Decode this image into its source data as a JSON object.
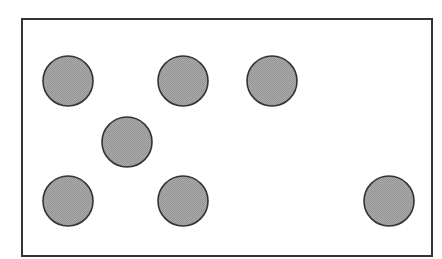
{
  "diagram": {
    "background": "#ffffff",
    "frame": {
      "x": 22,
      "y": 19,
      "width": 410,
      "height": 237,
      "stroke": "#333333",
      "stroke_width": 2
    },
    "circle_style": {
      "radius": 25,
      "fill": "#a3a3a3",
      "stroke": "#333333",
      "stroke_width": 1.6
    },
    "circles": [
      {
        "cx": 68,
        "cy": 81
      },
      {
        "cx": 183,
        "cy": 81
      },
      {
        "cx": 272,
        "cy": 81
      },
      {
        "cx": 127,
        "cy": 142
      },
      {
        "cx": 68,
        "cy": 201
      },
      {
        "cx": 183,
        "cy": 201
      },
      {
        "cx": 389,
        "cy": 201
      }
    ]
  }
}
